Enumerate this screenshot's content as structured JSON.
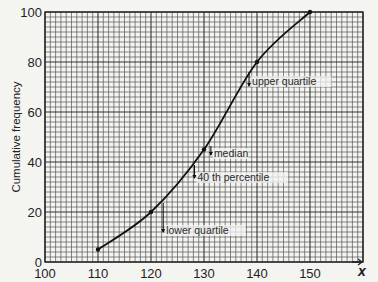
{
  "chart_data": {
    "type": "line",
    "title": "",
    "xlabel": "x",
    "ylabel": "Cumulative frequency",
    "xlim": [
      100,
      160
    ],
    "ylim": [
      0,
      100
    ],
    "grid": true,
    "x_ticks": [
      100,
      110,
      120,
      130,
      140,
      150
    ],
    "y_ticks": [
      0,
      20,
      40,
      60,
      80,
      100
    ],
    "x_tick_labels": [
      "100",
      "110",
      "120",
      "130",
      "140",
      "150"
    ],
    "y_tick_labels": [
      "0",
      "20",
      "40",
      "60",
      "80",
      "100"
    ],
    "series": [
      {
        "name": "Cumulative frequency curve",
        "x": [
          110,
          120,
          130,
          140,
          150
        ],
        "y": [
          5,
          20,
          45,
          80,
          100
        ]
      }
    ],
    "annotations": [
      {
        "label": "lower quartile",
        "x": 122.3
      },
      {
        "label": "40 th percentile",
        "x": 128.2
      },
      {
        "label": "median",
        "x": 131.3
      },
      {
        "label": "upper quartile",
        "x": 138.5
      }
    ]
  }
}
